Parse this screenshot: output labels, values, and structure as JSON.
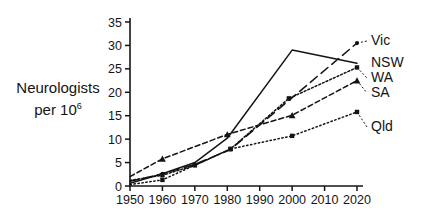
{
  "axis_title": {
    "line1": "Neurologists",
    "line2_prefix": "per 10",
    "line2_sup": "6"
  },
  "chart_data": {
    "type": "line",
    "title": "",
    "xlabel": "",
    "ylabel": "Neurologists per 10^6",
    "xlim": [
      1950,
      2020
    ],
    "ylim": [
      0,
      35
    ],
    "grid": false,
    "legend_position": "right-end-of-line",
    "x_ticks": [
      1950,
      1960,
      1970,
      1980,
      1990,
      2000,
      2010,
      2020
    ],
    "x_tick_labels": [
      "1950",
      "1960",
      "1970",
      "1980",
      "1990",
      "2000",
      "2010",
      "2020"
    ],
    "y_ticks": [
      0,
      5,
      10,
      15,
      20,
      25,
      30,
      35
    ],
    "y_tick_labels": [
      "0",
      "5",
      "10",
      "15",
      "20",
      "25",
      "30",
      "35"
    ],
    "series": [
      {
        "name": "Vic",
        "style": "long-dash",
        "marker": "dot",
        "x": [
          1950,
          1960,
          1970,
          1981,
          2020
        ],
        "values": [
          1.0,
          2.6,
          4.6,
          7.8,
          30.5
        ]
      },
      {
        "name": "NSW",
        "style": "solid",
        "marker": "none",
        "x": [
          1950,
          1960,
          1970,
          1980,
          2000,
          2020
        ],
        "values": [
          0.6,
          2.6,
          5.0,
          10.2,
          29.0,
          26.2
        ]
      },
      {
        "name": "WA",
        "style": "dotted",
        "marker": "square",
        "x": [
          1950,
          1960,
          1970,
          1981,
          1999,
          2020
        ],
        "values": [
          1.2,
          2.3,
          4.4,
          7.9,
          18.7,
          25.3
        ]
      },
      {
        "name": "SA",
        "style": "dashed",
        "marker": "triangle",
        "x": [
          1950,
          1960,
          1980,
          2000,
          2020
        ],
        "values": [
          2.0,
          5.8,
          11.0,
          15.1,
          22.5
        ]
      },
      {
        "name": "Qld",
        "style": "fine-dotted",
        "marker": "square",
        "x": [
          1950,
          1960,
          1981,
          2000,
          2020
        ],
        "values": [
          0.3,
          1.3,
          7.9,
          10.7,
          15.8
        ]
      }
    ]
  }
}
